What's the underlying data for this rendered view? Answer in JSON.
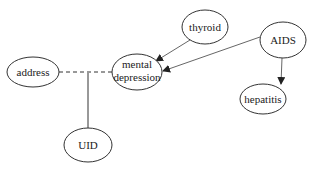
{
  "diagram": {
    "nodes": [
      {
        "id": "address",
        "label": "address",
        "cx": 33,
        "cy": 72,
        "rx": 26,
        "ry": 15
      },
      {
        "id": "mental_depression",
        "label": "mental",
        "label2": "depression",
        "cx": 137,
        "cy": 72,
        "rx": 25,
        "ry": 18
      },
      {
        "id": "thyroid",
        "label": "thyroid",
        "cx": 205,
        "cy": 27,
        "rx": 23,
        "ry": 17
      },
      {
        "id": "aids",
        "label": "AIDS",
        "cx": 283,
        "cy": 40,
        "rx": 23,
        "ry": 18
      },
      {
        "id": "hepatitis",
        "label": "hepatitis",
        "cx": 263,
        "cy": 99,
        "rx": 23,
        "ry": 15
      },
      {
        "id": "uid",
        "label": "UID",
        "cx": 88,
        "cy": 145,
        "rx": 24,
        "ry": 17
      }
    ],
    "edges": [
      {
        "from": "thyroid",
        "to": "mental_depression",
        "style": "arrow"
      },
      {
        "from": "aids",
        "to": "mental_depression",
        "style": "arrow"
      },
      {
        "from": "aids",
        "to": "hepatitis",
        "style": "arrow"
      },
      {
        "from": "address",
        "to": "mental_depression",
        "style": "dashed"
      },
      {
        "from": "address-mental_depression-link",
        "to": "uid",
        "style": "solid"
      }
    ]
  }
}
